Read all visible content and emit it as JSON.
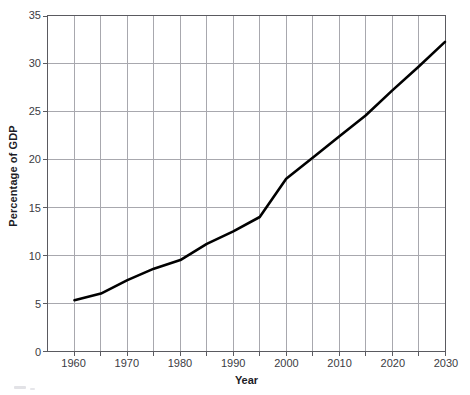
{
  "chart_data": {
    "type": "line",
    "title": "",
    "xlabel": "Year",
    "ylabel": "Percentage of GDP",
    "xlim": [
      1955,
      2030
    ],
    "ylim": [
      0,
      35
    ],
    "xticks": [
      1960,
      1965,
      1970,
      1975,
      1980,
      1985,
      1990,
      1995,
      2000,
      2005,
      2010,
      2015,
      2020,
      2025,
      2030
    ],
    "xtick_labels": [
      "1960",
      "",
      "1970",
      "",
      "1980",
      "",
      "1990",
      "",
      "2000",
      "",
      "2010",
      "",
      "2020",
      "",
      "2030"
    ],
    "yticks": [
      0,
      5,
      10,
      15,
      20,
      25,
      30,
      35
    ],
    "ytick_labels": [
      "0",
      "5",
      "10",
      "15",
      "20",
      "25",
      "30",
      "35"
    ],
    "grid": true,
    "grid_color": "#a8a8ae",
    "legend": false,
    "line_color": "#000000",
    "line_width": 2.6,
    "x": [
      1960,
      1965,
      1970,
      1975,
      1980,
      1985,
      1990,
      1995,
      2000,
      2005,
      2010,
      2015,
      2020,
      2025,
      2030
    ],
    "values": [
      5.3,
      6.0,
      7.4,
      8.6,
      9.5,
      11.2,
      12.5,
      14.0,
      18.0,
      20.2,
      22.4,
      24.6,
      27.2,
      29.7,
      32.3
    ]
  },
  "axes": {
    "y_title": "Percentage of GDP",
    "x_title": "Year"
  }
}
